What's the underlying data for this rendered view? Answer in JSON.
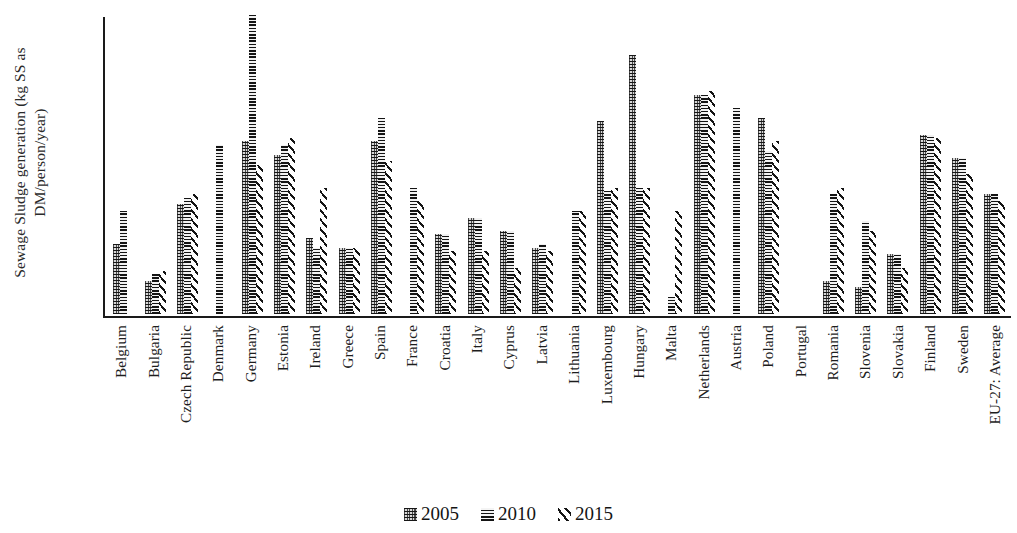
{
  "chart_data": {
    "type": "bar",
    "title": "",
    "xlabel": "",
    "ylabel": "Sewage Sludge generation (kg SS as DM/person/year)",
    "ylim": [
      0,
      45
    ],
    "yticks": [
      0,
      15,
      30,
      45
    ],
    "grid": false,
    "legend_position": "bottom",
    "categories": [
      "Belgium",
      "Bulgaria",
      "Czech Republic",
      "Denmark",
      "Germany",
      "Estonia",
      "Ireland",
      "Greece",
      "Spain",
      "France",
      "Croatia",
      "Italy",
      "Cyprus",
      "Latvia",
      "Lithuania",
      "Luxembourg",
      "Hungary",
      "Malta",
      "Netherlands",
      "Austria",
      "Poland",
      "Portugal",
      "Romania",
      "Slovenia",
      "Slovakia",
      "Finland",
      "Sweden",
      "EU-27: Average"
    ],
    "series": [
      {
        "name": "2005",
        "values": [
          10.5,
          5.0,
          16.5,
          null,
          26.0,
          24.0,
          11.5,
          10.0,
          26.0,
          null,
          12.0,
          14.5,
          12.5,
          10.0,
          null,
          29.0,
          39.0,
          null,
          33.0,
          null,
          29.5,
          null,
          5.0,
          4.0,
          9.0,
          27.0,
          23.5,
          18.0
        ]
      },
      {
        "name": "2010",
        "values": [
          15.5,
          6.0,
          17.5,
          25.5,
          45.0,
          25.5,
          10.0,
          10.0,
          29.5,
          19.0,
          12.0,
          14.5,
          12.5,
          10.5,
          15.5,
          18.5,
          19.0,
          2.5,
          33.0,
          31.0,
          24.5,
          null,
          18.0,
          14.0,
          9.0,
          27.0,
          23.5,
          18.0
        ]
      },
      {
        "name": "2015",
        "values": [
          null,
          6.5,
          18.0,
          null,
          22.5,
          26.5,
          19.0,
          10.0,
          23.0,
          17.0,
          9.5,
          9.5,
          7.0,
          9.5,
          15.5,
          19.0,
          19.0,
          15.5,
          33.5,
          null,
          26.0,
          null,
          19.0,
          12.5,
          7.0,
          26.5,
          21.0,
          17.0
        ]
      }
    ]
  },
  "axis": {
    "y_tick_labels": [
      "0",
      "15",
      "30",
      "45"
    ],
    "y_title": "Sewage Sludge generation (kg SS as DM/person/year)"
  },
  "legend": {
    "items": [
      {
        "label": "2005",
        "pattern": "checker-swatch"
      },
      {
        "label": "2010",
        "pattern": "horizontal-lines-swatch"
      },
      {
        "label": "2015",
        "pattern": "diagonal-hatch-swatch"
      }
    ]
  }
}
